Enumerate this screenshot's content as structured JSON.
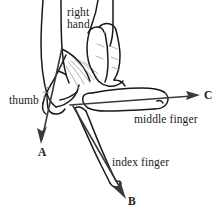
{
  "figure": {
    "background_color": "#ffffff",
    "ink_color": "#1a1a1a",
    "detail_ink_color": "#8d8d8d",
    "labels": {
      "right_hand_line1": "right",
      "right_hand_line2": "hand",
      "thumb": "thumb",
      "middle_finger": "middle finger",
      "index_finger": "index finger",
      "vector_a": "A",
      "vector_b": "B",
      "vector_c": "C"
    },
    "vectors": [
      {
        "name": "A",
        "label": "A",
        "associated_part": "thumb",
        "direction": "down-left",
        "tail": [
          62,
          48
        ],
        "head": [
          41,
          141
        ]
      },
      {
        "name": "B",
        "label": "B",
        "associated_part": "index finger",
        "direction": "down-right",
        "tail": [
          73,
          106
        ],
        "head": [
          126,
          196
        ]
      },
      {
        "name": "C",
        "label": "C",
        "associated_part": "middle finger",
        "direction": "right",
        "tail": [
          70,
          105
        ],
        "head": [
          199,
          95
        ]
      }
    ]
  }
}
